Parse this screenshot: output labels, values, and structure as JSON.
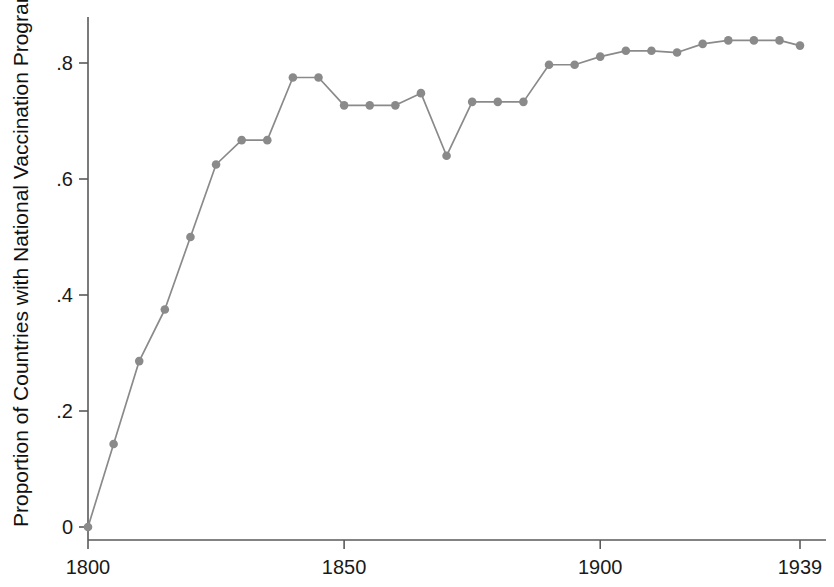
{
  "chart_data": {
    "type": "line",
    "title": "",
    "xlabel": "",
    "ylabel": "Proportion of Countries with National Vaccination Program",
    "xlim": [
      1800,
      1939
    ],
    "ylim": [
      0,
      0.88
    ],
    "xticks": [
      1800,
      1850,
      1900,
      1939
    ],
    "xticklabels": [
      "1800",
      "1850",
      "1900",
      "1939"
    ],
    "yticks": [
      0,
      0.2,
      0.4,
      0.6,
      0.8
    ],
    "yticklabels": [
      "0",
      ".2",
      ".4",
      ".6",
      ".8"
    ],
    "grid": false,
    "legend": false,
    "series": [
      {
        "name": "Proportion of Countries with National Vaccination Program",
        "color": "#8a8a8a",
        "marker": "circle",
        "x": [
          1800,
          1805,
          1810,
          1815,
          1820,
          1825,
          1830,
          1835,
          1840,
          1845,
          1850,
          1855,
          1860,
          1865,
          1870,
          1875,
          1880,
          1885,
          1890,
          1895,
          1900,
          1905,
          1910,
          1915,
          1920,
          1925,
          1930,
          1935,
          1939
        ],
        "y": [
          0.0,
          0.143,
          0.286,
          0.375,
          0.5,
          0.625,
          0.667,
          0.667,
          0.775,
          0.775,
          0.727,
          0.727,
          0.727,
          0.748,
          0.64,
          0.733,
          0.733,
          0.733,
          0.797,
          0.797,
          0.811,
          0.821,
          0.821,
          0.818,
          0.833,
          0.839,
          0.839,
          0.839,
          0.83
        ]
      }
    ]
  },
  "axes": {
    "y_axis_title": "Proportion of Countries with National Vaccination Program",
    "x_axis_title": ""
  }
}
